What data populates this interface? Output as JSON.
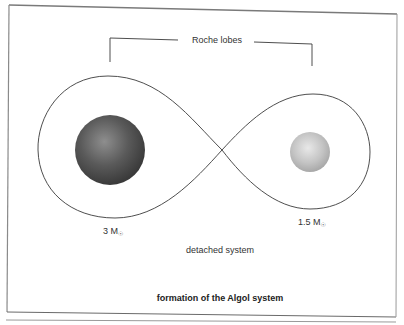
{
  "figure": {
    "bracket_label": "Roche lobes",
    "stars": [
      {
        "name": "primary",
        "mass_value": "3 M",
        "mass_symbol": "☉",
        "shade": "dark",
        "color_center": "#8c8c8c",
        "color_edge": "#3c3c3c"
      },
      {
        "name": "secondary",
        "mass_value": "1.5 M",
        "mass_symbol": "☉",
        "shade": "light",
        "color_center": "#e6e6e6",
        "color_edge": "#a9a9a9"
      }
    ],
    "system_state": "detached system",
    "caption": "formation of the Algol system"
  },
  "colors": {
    "line": "#3a3a3a",
    "frame": "#6a6a6a",
    "background": "#ffffff"
  }
}
